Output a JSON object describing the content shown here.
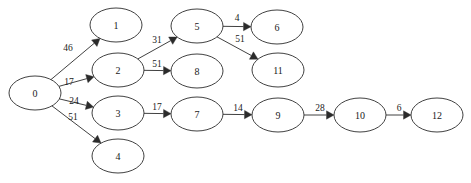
{
  "diagram": {
    "type": "directed-weighted-graph",
    "title": "",
    "node_shape": "ellipse",
    "node_rx": 26,
    "node_ry": 17,
    "colors": {
      "background": "#ffffff",
      "stroke": "#2b2b2b",
      "node_fill": "#ffffff",
      "text": "#1a1a1a"
    },
    "nodes": [
      {
        "id": "0",
        "label": "0",
        "x": 35,
        "y": 93
      },
      {
        "id": "1",
        "label": "1",
        "x": 116,
        "y": 25
      },
      {
        "id": "2",
        "label": "2",
        "x": 118,
        "y": 70
      },
      {
        "id": "3",
        "label": "3",
        "x": 118,
        "y": 113
      },
      {
        "id": "4",
        "label": "4",
        "x": 118,
        "y": 156
      },
      {
        "id": "5",
        "label": "5",
        "x": 197,
        "y": 26
      },
      {
        "id": "8",
        "label": "8",
        "x": 197,
        "y": 71
      },
      {
        "id": "7",
        "label": "7",
        "x": 197,
        "y": 114
      },
      {
        "id": "6",
        "label": "6",
        "x": 277,
        "y": 27
      },
      {
        "id": "11",
        "label": "11",
        "x": 278,
        "y": 70
      },
      {
        "id": "9",
        "label": "9",
        "x": 278,
        "y": 115
      },
      {
        "id": "10",
        "label": "10",
        "x": 360,
        "y": 115
      },
      {
        "id": "12",
        "label": "12",
        "x": 437,
        "y": 115
      }
    ],
    "edges": [
      {
        "from": "0",
        "to": "1",
        "weight": "46",
        "lx": 68,
        "ly": 48
      },
      {
        "from": "0",
        "to": "2",
        "weight": "17",
        "lx": 69,
        "ly": 82
      },
      {
        "from": "0",
        "to": "3",
        "weight": "24",
        "lx": 74,
        "ly": 101
      },
      {
        "from": "0",
        "to": "4",
        "weight": "51",
        "lx": 73,
        "ly": 117
      },
      {
        "from": "2",
        "to": "5",
        "weight": "31",
        "lx": 157,
        "ly": 40
      },
      {
        "from": "2",
        "to": "8",
        "weight": "51",
        "lx": 157,
        "ly": 64
      },
      {
        "from": "5",
        "to": "6",
        "weight": "4",
        "lx": 237,
        "ly": 18
      },
      {
        "from": "5",
        "to": "11",
        "weight": "51",
        "lx": 240,
        "ly": 39
      },
      {
        "from": "3",
        "to": "7",
        "weight": "17",
        "lx": 157,
        "ly": 107
      },
      {
        "from": "7",
        "to": "9",
        "weight": "14",
        "lx": 238,
        "ly": 108
      },
      {
        "from": "9",
        "to": "10",
        "weight": "28",
        "lx": 320,
        "ly": 108
      },
      {
        "from": "10",
        "to": "12",
        "weight": "6",
        "lx": 399,
        "ly": 108
      }
    ]
  }
}
